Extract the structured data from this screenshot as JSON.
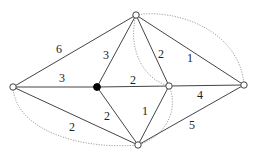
{
  "diagram": {
    "type": "weighted-graph",
    "nodes": [
      {
        "id": "top",
        "x": 136,
        "y": 15,
        "filled": false
      },
      {
        "id": "left",
        "x": 13,
        "y": 87,
        "filled": false
      },
      {
        "id": "center",
        "x": 97,
        "y": 87,
        "filled": true
      },
      {
        "id": "mid-right",
        "x": 169,
        "y": 86,
        "filled": false
      },
      {
        "id": "right",
        "x": 244,
        "y": 85,
        "filled": false
      },
      {
        "id": "bottom",
        "x": 138,
        "y": 145,
        "filled": false
      }
    ],
    "edges": [
      {
        "from": "left",
        "to": "top",
        "weight": "6"
      },
      {
        "from": "left",
        "to": "center",
        "weight": "3"
      },
      {
        "from": "left",
        "to": "bottom",
        "weight": "2"
      },
      {
        "from": "center",
        "to": "top",
        "weight": "3"
      },
      {
        "from": "center",
        "to": "mid-right",
        "weight": "2"
      },
      {
        "from": "center",
        "to": "bottom",
        "weight": "2"
      },
      {
        "from": "top",
        "to": "mid-right",
        "weight": "2"
      },
      {
        "from": "top",
        "to": "right",
        "weight": "1"
      },
      {
        "from": "mid-right",
        "to": "right",
        "weight": "4"
      },
      {
        "from": "mid-right",
        "to": "bottom",
        "weight": "1"
      },
      {
        "from": "bottom",
        "to": "right",
        "weight": "5"
      }
    ],
    "dotted_curves": [
      {
        "from": "top",
        "to": "right"
      },
      {
        "from": "top",
        "to": "mid-right"
      },
      {
        "from": "mid-right",
        "to": "bottom"
      },
      {
        "from": "left",
        "to": "bottom"
      }
    ],
    "labels": {
      "e_left_top": "6",
      "e_left_center": "3",
      "e_left_bottom": "2",
      "e_center_top": "3",
      "e_center_mid": "2",
      "e_center_bottom": "2",
      "e_top_mid": "2",
      "e_top_right": "1",
      "e_mid_right": "4",
      "e_mid_bottom": "1",
      "e_bottom_right": "5"
    }
  }
}
